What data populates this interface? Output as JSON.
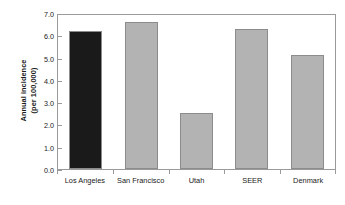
{
  "chart_data": {
    "type": "bar",
    "title": "",
    "xlabel": "",
    "ylabel": "Annual incidence (per 100,000)",
    "ylabel_line1": "Annual incidence",
    "ylabel_line2": "(per 100,000)",
    "categories": [
      "Los Angeles",
      "San Francisco",
      "Utah",
      "SEER",
      "Denmark"
    ],
    "values": [
      6.2,
      6.6,
      2.5,
      6.3,
      5.1
    ],
    "bar_colors": [
      "#1a1a1a",
      "#b3b3b3",
      "#b3b3b3",
      "#b3b3b3",
      "#b3b3b3"
    ],
    "ylim": [
      0.0,
      7.0
    ],
    "ytick_values": [
      0.0,
      1.0,
      2.0,
      3.0,
      4.0,
      5.0,
      6.0,
      7.0
    ],
    "ytick_labels": [
      "0.0",
      "1.0",
      "2.0",
      "3.0",
      "4.0",
      "5.0",
      "6.0",
      "7.0"
    ],
    "grid": false,
    "legend": "none",
    "frame": true
  },
  "style": {
    "bar_fill_gray": "#b3b3b3",
    "bar_fill_black": "#1a1a1a",
    "bar_border": "#8c8c8c",
    "axis_color": "#9a9a9a",
    "text_color": "#1a1a1a",
    "background": "#ffffff"
  }
}
